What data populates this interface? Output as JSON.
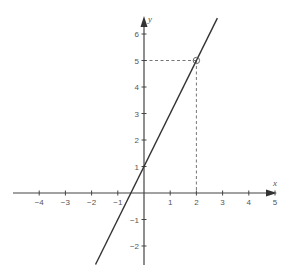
{
  "chart_data": {
    "type": "line",
    "title": "",
    "xlabel": "x",
    "ylabel": "y",
    "xlim": [
      -5.0,
      5.0
    ],
    "ylim": [
      -2.7,
      6.6
    ],
    "grid": false,
    "x_ticks": [
      -4,
      -3,
      -2,
      -1,
      1,
      2,
      3,
      4,
      5
    ],
    "y_ticks": [
      -2,
      -1,
      1,
      2,
      3,
      4,
      5,
      6
    ],
    "x_tick_labels": [
      "−4",
      "−3",
      "−2",
      "−1",
      "1",
      "2",
      "3",
      "4",
      "5"
    ],
    "y_tick_labels": [
      "−2",
      "−1",
      "1",
      "2",
      "3",
      "4",
      "5",
      "6"
    ],
    "series": [
      {
        "name": "y = 2x + 1",
        "x": [
          -1.85,
          2.8
        ],
        "y": [
          -2.7,
          6.6
        ],
        "color": "#333333"
      }
    ],
    "annotations": [
      {
        "type": "point",
        "x": 2,
        "y": 5,
        "marker": "open-circle"
      },
      {
        "type": "dashed-guide",
        "from": [
          0,
          5
        ],
        "to": [
          2,
          5
        ]
      },
      {
        "type": "dashed-guide",
        "from": [
          2,
          5
        ],
        "to": [
          2,
          0
        ]
      }
    ]
  },
  "labels": {
    "x_axis": "x",
    "y_axis": "y"
  },
  "colors": {
    "axis": "#444444",
    "line": "#333333",
    "guide": "#666666",
    "text": "#555555"
  }
}
